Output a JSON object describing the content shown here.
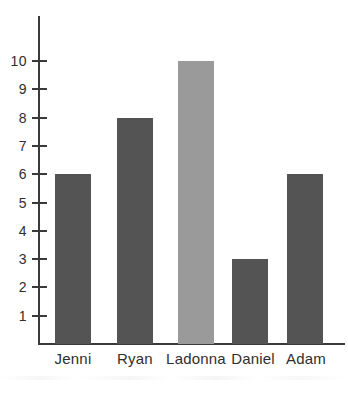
{
  "chart_data": {
    "type": "bar",
    "title": "",
    "subtitle": "",
    "xlabel": "",
    "ylabel": "",
    "categories": [
      "Jenni",
      "Ryan",
      "Ladonna",
      "Daniel",
      "Adam"
    ],
    "values": [
      6,
      8,
      10,
      3,
      6
    ],
    "ylim": [
      0,
      10.5
    ],
    "y_ticks": [
      1,
      2,
      3,
      4,
      5,
      6,
      7,
      8,
      9,
      10
    ],
    "y_tick_labels": [
      "1",
      "2",
      "3",
      "4",
      "5",
      "6",
      "7",
      "8",
      "9",
      "10"
    ],
    "grid": false,
    "legend": false,
    "legend_position": "none",
    "bar_colors": [
      "#545454",
      "#545454",
      "#9a9a9a",
      "#545454",
      "#545454"
    ],
    "axis_color": "#3a3a3a",
    "background_color": "#ffffff",
    "text_color": "#2e2e2e"
  }
}
